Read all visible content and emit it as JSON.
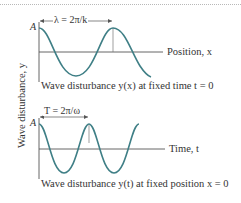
{
  "figure": {
    "y_axis_label": "Wave disturbance, y",
    "curve_color": "#3f7f86",
    "axis_color": "#555555",
    "top_panel": {
      "amplitude_label": "A",
      "dimension_label": "λ = 2π/k",
      "x_axis_label": "Position, x",
      "caption": "Wave disturbance y(x) at fixed time t = 0"
    },
    "bottom_panel": {
      "amplitude_label": "A",
      "dimension_label": "T = 2π/ω",
      "x_axis_label": "Time, t",
      "caption": "Wave disturbance y(t) at fixed position x = 0"
    }
  }
}
